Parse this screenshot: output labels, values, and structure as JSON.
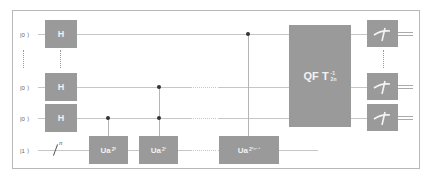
{
  "diagram": {
    "type": "quantum-circuit",
    "colors": {
      "gate_fill": "#9a9a9a",
      "gate_text": "#f2f2f2",
      "wire": "#c6c6c6",
      "frame": "#b8b8b8",
      "control_dot": "#333333"
    },
    "qubits": [
      {
        "label": "|0 ⟩",
        "y": 34
      },
      {
        "label": "|0 ⟩",
        "y": 87
      },
      {
        "label": "|0 ⟩",
        "y": 118
      },
      {
        "label": "|1 ⟩",
        "y": 150
      }
    ],
    "register_size_label": "n",
    "hadamard_label": "H",
    "u_gates": [
      {
        "base": "Ua",
        "exp": "2⁰"
      },
      {
        "base": "Ua",
        "exp": "2¹"
      },
      {
        "base": "Ua",
        "exp": "2²ⁿ⁻¹"
      }
    ],
    "qft": {
      "main": "QF T",
      "sup": "-1",
      "sub": "2n"
    },
    "measurement_count": 3
  }
}
